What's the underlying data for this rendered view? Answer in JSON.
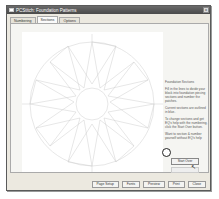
{
  "window": {
    "title": "PCStitch: Foundation Patterns",
    "close_label": "x"
  },
  "tabs": [
    {
      "label": "Numbering",
      "active": false
    },
    {
      "label": "Sections",
      "active": true
    },
    {
      "label": "Options",
      "active": false
    }
  ],
  "info": {
    "heading": "Foundation Sections",
    "paragraph1": "Fill in the lines to divide your block into foundation piecing sections and number the patches.",
    "paragraph2": "Current sections are outlined in blue.",
    "paragraph3": "To change sections and get EQ's help with the numbering, click the Start Over button.",
    "highlight_text": "Want to section & number yourself without EQ's help",
    "start_over_label": "Start Over"
  },
  "footer": {
    "buttons": [
      "Page Setup",
      "Fonts",
      "Preview",
      "Print",
      "Close"
    ]
  },
  "colors": {
    "pattern_line": "#c8c8c8",
    "titlebar": "#555555"
  }
}
